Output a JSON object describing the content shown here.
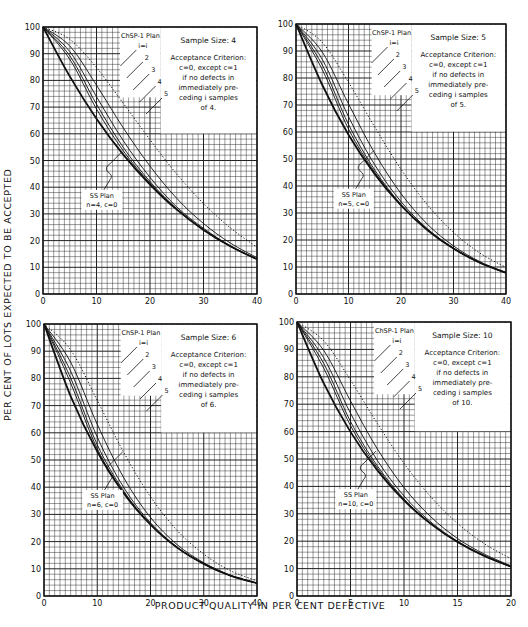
{
  "figure": {
    "y_axis_label": "PER CENT OF LOTS EXPECTED TO BE ACCEPTED",
    "x_axis_label": "PRODUCT QUALITY IN PER CENT DEFECTIVE",
    "caption_fragment": ""
  },
  "chart_data": [
    {
      "type": "line",
      "panel": "top-left",
      "title": "Sample Size: 4",
      "annotation": [
        "Acceptance Criterion:",
        "c=0, except c=1",
        "if no defects in",
        "immediately pre-",
        "ceding i samples",
        "of 4."
      ],
      "plan_label": "ChSP-1 Plan",
      "ss_label": [
        "SS Plan",
        "n=4, c=0"
      ],
      "xlabel": "Product quality in per cent defective",
      "ylabel": "Per cent of lots expected to be accepted",
      "xlim": [
        0,
        40
      ],
      "ylim": [
        0,
        100
      ],
      "xticks": [
        0,
        10,
        20,
        30,
        40
      ],
      "yticks": [
        0,
        10,
        20,
        30,
        40,
        50,
        60,
        70,
        80,
        90,
        100
      ],
      "grid": true,
      "x": [
        0,
        5,
        10,
        15,
        20,
        25,
        30,
        35,
        40
      ],
      "series": [
        {
          "name": "i=1",
          "style": "dotted",
          "values": [
            100,
            95.4,
            84.8,
            71.4,
            57.8,
            44.9,
            33.9,
            24.8,
            17.5
          ]
        },
        {
          "name": "i=2",
          "style": "thin",
          "values": [
            100,
            92.9,
            78.2,
            62.2,
            47.9,
            35.8,
            26.4,
            19.1,
            13.6
          ]
        },
        {
          "name": "i=3",
          "style": "thin",
          "values": [
            100,
            90.8,
            73.9,
            57.4,
            43.7,
            32.6,
            24.6,
            18.1,
            13.1
          ]
        },
        {
          "name": "i=4",
          "style": "thin",
          "values": [
            100,
            89.2,
            71.1,
            54.9,
            42.1,
            31.9,
            24.1,
            17.9,
            13.0
          ]
        },
        {
          "name": "i=5",
          "style": "thin",
          "values": [
            100,
            87.9,
            69.3,
            53.6,
            41.5,
            31.7,
            24.0,
            17.9,
            13.0
          ]
        },
        {
          "name": "SS Plan n=4, c=0",
          "style": "bold",
          "values": [
            100,
            81.5,
            65.6,
            52.2,
            41.0,
            31.6,
            24.0,
            17.9,
            13.0
          ]
        }
      ],
      "curve_labels": [
        "i=i",
        "2",
        "3",
        "4",
        "5"
      ]
    },
    {
      "type": "line",
      "panel": "top-right",
      "title": "Sample Size: 5",
      "annotation": [
        "Acceptance Criterion:",
        "c=0, except c=1",
        "if no defects in",
        "immediately pre-",
        "ceding i samples",
        "of 5."
      ],
      "plan_label": "ChSP-1 Plan",
      "ss_label": [
        "SS Plan",
        "n=5, c=0"
      ],
      "xlim": [
        0,
        40
      ],
      "ylim": [
        0,
        100
      ],
      "xticks": [
        0,
        10,
        20,
        30,
        40
      ],
      "yticks": [
        0,
        10,
        20,
        30,
        40,
        50,
        60,
        70,
        80,
        90,
        100
      ],
      "grid": true,
      "x": [
        0,
        5,
        10,
        15,
        20,
        25,
        30,
        35,
        40
      ],
      "series": [
        {
          "name": "i=1",
          "style": "dotted",
          "values": [
            100,
            93.2,
            78.4,
            61.8,
            46.2,
            33.1,
            22.8,
            15.2,
            9.8
          ]
        },
        {
          "name": "i=2",
          "style": "thin",
          "values": [
            100,
            89.6,
            70.4,
            52.1,
            37.2,
            25.9,
            17.8,
            12.0,
            8.0
          ]
        },
        {
          "name": "i=3",
          "style": "thin",
          "values": [
            100,
            86.9,
            65.7,
            47.8,
            34.2,
            24.2,
            17.0,
            11.6,
            7.8
          ]
        },
        {
          "name": "i=4",
          "style": "thin",
          "values": [
            100,
            84.8,
            62.8,
            45.9,
            33.2,
            23.8,
            16.8,
            11.6,
            7.8
          ]
        },
        {
          "name": "i=5",
          "style": "thin",
          "values": [
            100,
            83.1,
            61.1,
            45.1,
            32.9,
            23.7,
            16.8,
            11.6,
            7.8
          ]
        },
        {
          "name": "SS Plan n=5, c=0",
          "style": "bold",
          "values": [
            100,
            77.4,
            59.0,
            44.4,
            32.8,
            23.7,
            16.8,
            11.6,
            7.8
          ]
        }
      ],
      "curve_labels": [
        "i=i",
        "2",
        "3",
        "4",
        "5"
      ]
    },
    {
      "type": "line",
      "panel": "bottom-left",
      "title": "Sample Size: 6",
      "annotation": [
        "Acceptance Criterion:",
        "c=0, except c=1",
        "if no defects in",
        "immediately pre-",
        "ceding i samples",
        "of 6."
      ],
      "plan_label": "ChSP-1 Plan",
      "ss_label": [
        "SS Plan",
        "n=6, c=0"
      ],
      "xlim": [
        0,
        40
      ],
      "ylim": [
        0,
        100
      ],
      "xticks": [
        0,
        10,
        20,
        30,
        40
      ],
      "yticks": [
        0,
        10,
        20,
        30,
        40,
        50,
        60,
        70,
        80,
        90,
        100
      ],
      "grid": true,
      "x": [
        0,
        5,
        10,
        15,
        20,
        25,
        30,
        35,
        40
      ],
      "series": [
        {
          "name": "i=1",
          "style": "dotted",
          "values": [
            100,
            90.5,
            71.9,
            52.7,
            36.5,
            24.1,
            15.4,
            9.3,
            5.6
          ]
        },
        {
          "name": "i=2",
          "style": "thin",
          "values": [
            100,
            86.0,
            63.1,
            43.4,
            28.9,
            18.9,
            12.2,
            7.6,
            4.7
          ]
        },
        {
          "name": "i=3",
          "style": "thin",
          "values": [
            100,
            82.7,
            58.4,
            39.8,
            26.9,
            18.0,
            11.8,
            7.5,
            4.7
          ]
        },
        {
          "name": "i=4",
          "style": "thin",
          "values": [
            100,
            80.2,
            55.6,
            38.5,
            26.4,
            17.8,
            11.8,
            7.5,
            4.7
          ]
        },
        {
          "name": "i=5",
          "style": "thin",
          "values": [
            100,
            78.3,
            54.1,
            38.0,
            26.3,
            17.8,
            11.8,
            7.5,
            4.7
          ]
        },
        {
          "name": "SS Plan n=6, c=0",
          "style": "bold",
          "values": [
            100,
            73.5,
            53.1,
            37.7,
            26.2,
            17.8,
            11.8,
            7.5,
            4.7
          ]
        }
      ],
      "curve_labels": [
        "i=i",
        "2",
        "3",
        "4",
        "5"
      ]
    },
    {
      "type": "line",
      "panel": "bottom-right",
      "title": "Sample Size: 10",
      "annotation": [
        "Acceptance Criterion:",
        "c=0, except c=1",
        "if no defects in",
        "immediately pre-",
        "ceding i samples",
        "of 10."
      ],
      "plan_label": "ChSP-1 Plan",
      "ss_label": [
        "SS Plan",
        "n=10, c=0"
      ],
      "xlim": [
        0,
        20
      ],
      "ylim": [
        0,
        100
      ],
      "xticks": [
        0,
        5,
        10,
        15,
        20
      ],
      "yticks": [
        0,
        10,
        20,
        30,
        40,
        50,
        60,
        70,
        80,
        90,
        100
      ],
      "grid": true,
      "x": [
        0,
        2.5,
        5,
        7.5,
        10,
        12.5,
        15,
        17.5,
        20
      ],
      "series": [
        {
          "name": "i=1",
          "style": "dotted",
          "values": [
            100,
            93.1,
            78.8,
            63.0,
            48.4,
            36.2,
            26.5,
            19.1,
            13.6
          ]
        },
        {
          "name": "i=2",
          "style": "thin",
          "values": [
            100,
            89.6,
            71.2,
            53.7,
            39.6,
            28.9,
            21.0,
            15.3,
            11.0
          ]
        },
        {
          "name": "i=3",
          "style": "thin",
          "values": [
            100,
            86.9,
            66.7,
            49.5,
            36.5,
            27.0,
            20.0,
            14.8,
            10.7
          ]
        },
        {
          "name": "i=4",
          "style": "thin",
          "values": [
            100,
            84.8,
            63.7,
            47.5,
            35.4,
            26.5,
            19.8,
            14.7,
            10.7
          ]
        },
        {
          "name": "i=5",
          "style": "thin",
          "values": [
            100,
            83.1,
            62.2,
            46.7,
            35.1,
            26.4,
            19.7,
            14.6,
            10.7
          ]
        },
        {
          "name": "SS Plan n=10, c=0",
          "style": "bold",
          "values": [
            100,
            77.6,
            59.9,
            45.9,
            34.9,
            26.3,
            19.7,
            14.6,
            10.7
          ]
        }
      ],
      "curve_labels": [
        "i=i",
        "2",
        "3",
        "4",
        "5"
      ]
    }
  ]
}
